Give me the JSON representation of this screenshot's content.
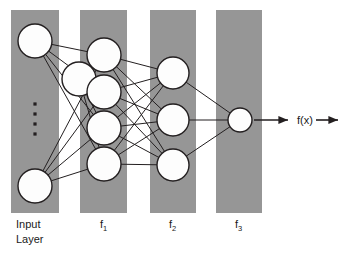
{
  "diagram": {
    "background_color": "#ffffff",
    "band_color": "#969696",
    "node_fill": "#fdfdfd",
    "node_stroke": "#231f20",
    "edge_color": "#231f20",
    "text_color": "#1a1a1a",
    "bands": [
      {
        "name": "input-layer-band",
        "x": 11,
        "y": 10,
        "width": 48,
        "height": 203
      },
      {
        "name": "f1-band",
        "x": 80,
        "y": 10,
        "width": 47,
        "height": 203
      },
      {
        "name": "f2-band",
        "x": 150,
        "y": 10,
        "width": 46,
        "height": 203
      },
      {
        "name": "f3-band",
        "x": 216,
        "y": 10,
        "width": 46,
        "height": 203
      }
    ],
    "layers": [
      {
        "id": "input",
        "label": "Input",
        "label_line2": "Layer",
        "subscript": "",
        "label_x": 16,
        "label_y": 228,
        "label_y2": 243,
        "node_radius": 17,
        "nodes": [
          {
            "cx": 35,
            "cy": 41
          },
          {
            "cx": 79,
            "cy": 79
          },
          {
            "cx": 35,
            "cy": 186
          }
        ],
        "ellipsis": {
          "cx": 35,
          "dot_size": 3.2,
          "dots_y": [
            104,
            114,
            124,
            134
          ]
        }
      },
      {
        "id": "f1",
        "label": "f",
        "subscript": "1",
        "label_x": 100,
        "label_y": 228,
        "node_radius": 17,
        "nodes": [
          {
            "cx": 104,
            "cy": 55
          },
          {
            "cx": 104,
            "cy": 92
          },
          {
            "cx": 104,
            "cy": 128
          },
          {
            "cx": 104,
            "cy": 164
          }
        ]
      },
      {
        "id": "f2",
        "label": "f",
        "subscript": "2",
        "label_x": 169,
        "label_y": 228,
        "node_radius": 16,
        "nodes": [
          {
            "cx": 173,
            "cy": 73
          },
          {
            "cx": 173,
            "cy": 120
          },
          {
            "cx": 173,
            "cy": 165
          }
        ]
      },
      {
        "id": "f3",
        "label": "f",
        "subscript": "3",
        "label_x": 235,
        "label_y": 228,
        "node_radius": 12,
        "nodes": [
          {
            "cx": 240,
            "cy": 120
          }
        ]
      }
    ],
    "output": {
      "label": "f(x)",
      "label_x": 297,
      "label_y": 124,
      "arrow_in": {
        "x1": 254,
        "y1": 120,
        "x2": 288,
        "y2": 120
      },
      "arrow_out": {
        "x1": 316,
        "y1": 120,
        "x2": 338,
        "y2": 120
      }
    },
    "input_node_indices_connected": [
      0,
      1,
      2
    ]
  }
}
